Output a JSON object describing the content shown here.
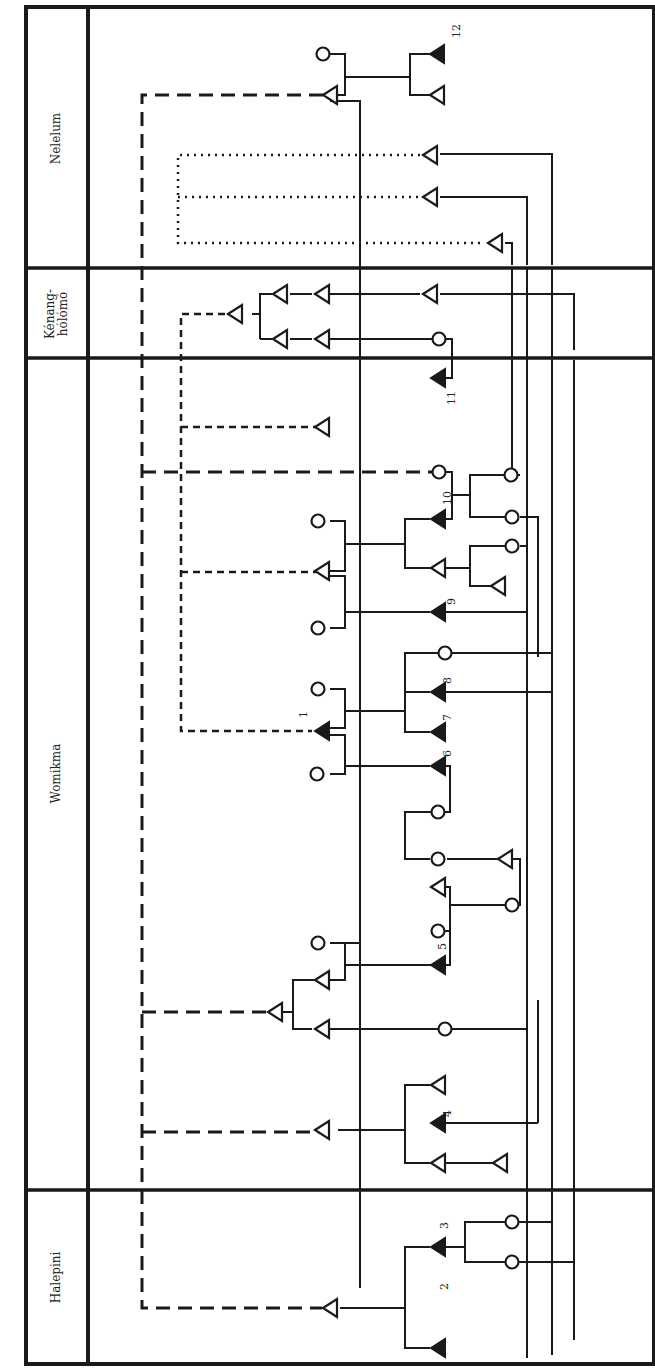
{
  "diagram": {
    "type": "kinship-chart",
    "orientation": "rotated-90-ccw",
    "sections": [
      {
        "id": "nelelum",
        "label": "Nelelum"
      },
      {
        "id": "kenang-holomo",
        "label": "Kénang-\nhólómó"
      },
      {
        "id": "womikma",
        "label": "Womikma"
      },
      {
        "id": "halepini",
        "label": "Halepini"
      }
    ],
    "legend_symbols": {
      "filled_triangle": "numbered individual (male, filled)",
      "open_triangle": "male",
      "circle": "female",
      "solid_line": "descent / kin link",
      "long_dash_line": "affiliation link",
      "short_dash_line": "affiliation link",
      "dotted_line": "affiliation link"
    },
    "numbered_individuals": [
      "1",
      "2",
      "3",
      "4",
      "5",
      "6",
      "7",
      "8",
      "9",
      "10",
      "11",
      "12"
    ],
    "colors": {
      "ink": "#1a1a1a",
      "background": "#ffffff"
    }
  }
}
